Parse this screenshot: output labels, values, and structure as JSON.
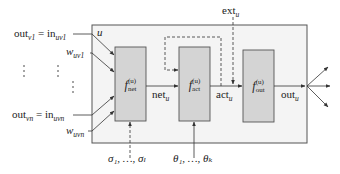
{
  "diagram": {
    "type": "neuron-model",
    "unit_label": "u",
    "inputs": [
      {
        "out": "out",
        "out_sub": "v1",
        "in": "in",
        "in_sub": "uv1",
        "weight": "w",
        "weight_sub": "uv1"
      },
      {
        "out": "out",
        "out_sub": "vn",
        "in": "in",
        "in_sub": "uvn",
        "weight": "w",
        "weight_sub": "uvn"
      }
    ],
    "ellipsis": "⋮",
    "equals": "=",
    "functions": [
      {
        "id": "net",
        "f": "f",
        "sup": "(u)",
        "sub": "net"
      },
      {
        "id": "act",
        "f": "f",
        "sup": "(u)",
        "sub": "act"
      },
      {
        "id": "out",
        "f": "f",
        "sup": "(u)",
        "sub": "out"
      }
    ],
    "signals": {
      "net": {
        "base": "net",
        "sub": "u"
      },
      "act": {
        "base": "act",
        "sub": "u"
      },
      "out": {
        "base": "out",
        "sub": "u"
      },
      "ext": {
        "base": "ext",
        "sub": "u"
      }
    },
    "parameters": {
      "sigma": "σ₁, …, σₗ",
      "theta": "θ₁, …, θₖ"
    },
    "colors": {
      "box_fill": "#f4f4f4",
      "function_fill": "#d4d4d4",
      "stroke": "#555555",
      "text": "#222222"
    }
  }
}
